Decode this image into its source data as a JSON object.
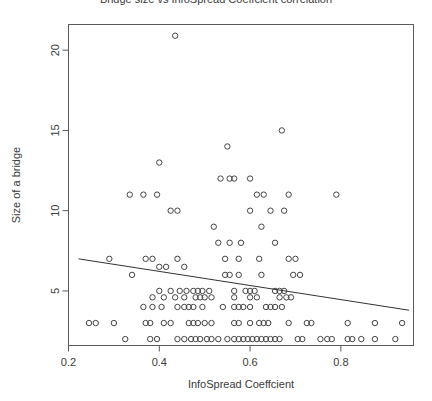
{
  "chart_data": {
    "type": "scatter",
    "title": "Bridge size vs InfoSpread Coeffcient correlation",
    "xlabel": "InfoSpread Coeffcient",
    "ylabel": "Size of a bridge",
    "xlim": [
      0.2,
      0.96
    ],
    "ylim": [
      1.6,
      21.6
    ],
    "xticks": [
      0.2,
      0.4,
      0.6,
      0.8
    ],
    "xticklabels": [
      "0.2",
      "0.4",
      "0.6",
      "0.8"
    ],
    "yticks": [
      5,
      10,
      15,
      20
    ],
    "yticklabels": [
      "5",
      "10",
      "15",
      "20"
    ],
    "grid": false,
    "legend": null,
    "marker": "open-circle",
    "marker_color": "#444444",
    "line_color": "#333333",
    "frame": true,
    "trendline": {
      "name": "linear fit",
      "x": [
        0.222,
        0.95
      ],
      "y": [
        7.0,
        3.8
      ]
    },
    "series": [
      {
        "name": "bridges",
        "points": [
          [
            0.435,
            20.9
          ],
          [
            0.67,
            15.0
          ],
          [
            0.55,
            14.0
          ],
          [
            0.4,
            13.0
          ],
          [
            0.535,
            12.0
          ],
          [
            0.555,
            12.0
          ],
          [
            0.565,
            12.0
          ],
          [
            0.6,
            12.0
          ],
          [
            0.335,
            11.0
          ],
          [
            0.365,
            11.0
          ],
          [
            0.395,
            11.0
          ],
          [
            0.615,
            11.0
          ],
          [
            0.63,
            11.0
          ],
          [
            0.685,
            11.0
          ],
          [
            0.79,
            11.0
          ],
          [
            0.425,
            10.0
          ],
          [
            0.44,
            10.0
          ],
          [
            0.6,
            10.0
          ],
          [
            0.645,
            10.0
          ],
          [
            0.675,
            10.0
          ],
          [
            0.52,
            9.0
          ],
          [
            0.625,
            9.0
          ],
          [
            0.53,
            8.0
          ],
          [
            0.555,
            8.0
          ],
          [
            0.58,
            8.0
          ],
          [
            0.655,
            8.0
          ],
          [
            0.29,
            7.0
          ],
          [
            0.37,
            7.0
          ],
          [
            0.385,
            7.0
          ],
          [
            0.44,
            7.0
          ],
          [
            0.545,
            7.0
          ],
          [
            0.575,
            7.0
          ],
          [
            0.62,
            7.0
          ],
          [
            0.685,
            7.0
          ],
          [
            0.7,
            7.0
          ],
          [
            0.4,
            6.5
          ],
          [
            0.415,
            6.5
          ],
          [
            0.455,
            6.5
          ],
          [
            0.34,
            6.0
          ],
          [
            0.545,
            6.0
          ],
          [
            0.555,
            6.0
          ],
          [
            0.575,
            6.0
          ],
          [
            0.625,
            6.0
          ],
          [
            0.695,
            6.0
          ],
          [
            0.71,
            6.0
          ],
          [
            0.4,
            5.0
          ],
          [
            0.425,
            5.0
          ],
          [
            0.445,
            5.0
          ],
          [
            0.46,
            5.0
          ],
          [
            0.475,
            5.0
          ],
          [
            0.485,
            5.0
          ],
          [
            0.495,
            5.0
          ],
          [
            0.51,
            5.0
          ],
          [
            0.565,
            5.0
          ],
          [
            0.59,
            5.0
          ],
          [
            0.6,
            5.0
          ],
          [
            0.61,
            5.0
          ],
          [
            0.655,
            5.0
          ],
          [
            0.665,
            5.0
          ],
          [
            0.675,
            5.0
          ],
          [
            0.385,
            4.6
          ],
          [
            0.41,
            4.6
          ],
          [
            0.435,
            4.6
          ],
          [
            0.455,
            4.6
          ],
          [
            0.48,
            4.6
          ],
          [
            0.49,
            4.6
          ],
          [
            0.5,
            4.6
          ],
          [
            0.515,
            4.6
          ],
          [
            0.565,
            4.6
          ],
          [
            0.6,
            4.6
          ],
          [
            0.615,
            4.6
          ],
          [
            0.665,
            4.6
          ],
          [
            0.68,
            4.6
          ],
          [
            0.69,
            4.6
          ],
          [
            0.365,
            4.0
          ],
          [
            0.385,
            4.0
          ],
          [
            0.405,
            4.0
          ],
          [
            0.44,
            4.0
          ],
          [
            0.455,
            4.0
          ],
          [
            0.465,
            4.0
          ],
          [
            0.475,
            4.0
          ],
          [
            0.495,
            4.0
          ],
          [
            0.54,
            4.0
          ],
          [
            0.565,
            4.0
          ],
          [
            0.575,
            4.0
          ],
          [
            0.585,
            4.0
          ],
          [
            0.6,
            4.0
          ],
          [
            0.635,
            4.0
          ],
          [
            0.645,
            4.0
          ],
          [
            0.655,
            4.0
          ],
          [
            0.67,
            4.0
          ],
          [
            0.245,
            3.0
          ],
          [
            0.26,
            3.0
          ],
          [
            0.3,
            3.0
          ],
          [
            0.37,
            3.0
          ],
          [
            0.38,
            3.0
          ],
          [
            0.41,
            3.0
          ],
          [
            0.425,
            3.0
          ],
          [
            0.465,
            3.0
          ],
          [
            0.475,
            3.0
          ],
          [
            0.485,
            3.0
          ],
          [
            0.5,
            3.0
          ],
          [
            0.515,
            3.0
          ],
          [
            0.565,
            3.0
          ],
          [
            0.575,
            3.0
          ],
          [
            0.6,
            3.0
          ],
          [
            0.62,
            3.0
          ],
          [
            0.63,
            3.0
          ],
          [
            0.64,
            3.0
          ],
          [
            0.685,
            3.0
          ],
          [
            0.725,
            3.0
          ],
          [
            0.735,
            3.0
          ],
          [
            0.815,
            3.0
          ],
          [
            0.875,
            3.0
          ],
          [
            0.325,
            2.0
          ],
          [
            0.38,
            2.0
          ],
          [
            0.395,
            2.0
          ],
          [
            0.44,
            2.0
          ],
          [
            0.455,
            2.0
          ],
          [
            0.47,
            2.0
          ],
          [
            0.48,
            2.0
          ],
          [
            0.49,
            2.0
          ],
          [
            0.505,
            2.0
          ],
          [
            0.515,
            2.0
          ],
          [
            0.53,
            2.0
          ],
          [
            0.55,
            2.0
          ],
          [
            0.565,
            2.0
          ],
          [
            0.575,
            2.0
          ],
          [
            0.585,
            2.0
          ],
          [
            0.595,
            2.0
          ],
          [
            0.605,
            2.0
          ],
          [
            0.615,
            2.0
          ],
          [
            0.625,
            2.0
          ],
          [
            0.635,
            2.0
          ],
          [
            0.645,
            2.0
          ],
          [
            0.655,
            2.0
          ],
          [
            0.665,
            2.0
          ],
          [
            0.705,
            2.0
          ],
          [
            0.715,
            2.0
          ],
          [
            0.755,
            2.0
          ],
          [
            0.77,
            2.0
          ],
          [
            0.78,
            2.0
          ],
          [
            0.815,
            2.0
          ],
          [
            0.825,
            2.0
          ],
          [
            0.845,
            2.0
          ],
          [
            0.875,
            2.0
          ],
          [
            0.92,
            2.0
          ],
          [
            0.935,
            3.0
          ]
        ]
      }
    ]
  }
}
